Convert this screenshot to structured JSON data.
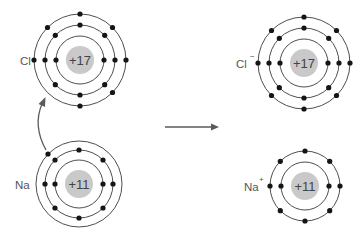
{
  "diagram": {
    "colors": {
      "ring": "#3a3a3a",
      "nucleus": "#c9c9c9",
      "electron": "#151515",
      "arrow": "#5a5a5a",
      "label": "#555555"
    },
    "atoms": [
      {
        "id": "cl",
        "label": "Cl",
        "charge": "",
        "nucleus_label": "+17",
        "cx": 80,
        "cy": 60,
        "shells": [
          {
            "r": 24,
            "electrons": 2
          },
          {
            "r": 35,
            "electrons": 8
          },
          {
            "r": 46,
            "electrons": 7
          }
        ]
      },
      {
        "id": "na",
        "label": "Na",
        "charge": "",
        "nucleus_label": "+11",
        "cx": 79,
        "cy": 184,
        "shells": [
          {
            "r": 24,
            "electrons": 2
          },
          {
            "r": 34,
            "electrons": 8
          },
          {
            "r": 43,
            "electrons": 1
          }
        ]
      },
      {
        "id": "cl-ion",
        "label": "Cl",
        "charge": "−",
        "nucleus_label": "+17",
        "cx": 304,
        "cy": 63,
        "shells": [
          {
            "r": 24,
            "electrons": 2
          },
          {
            "r": 35,
            "electrons": 8
          },
          {
            "r": 46,
            "electrons": 8
          }
        ]
      },
      {
        "id": "na-ion",
        "label": "Na",
        "charge": "+",
        "nucleus_label": "+11",
        "cx": 305,
        "cy": 186,
        "shells": [
          {
            "r": 24,
            "electrons": 2
          },
          {
            "r": 35,
            "electrons": 8
          }
        ]
      }
    ],
    "arrows": [
      {
        "id": "electron-transfer-arrow",
        "from": "Na outer electron",
        "to": "Cl outer shell"
      },
      {
        "id": "reaction-arrow",
        "from": "reactants",
        "to": "products"
      }
    ]
  }
}
